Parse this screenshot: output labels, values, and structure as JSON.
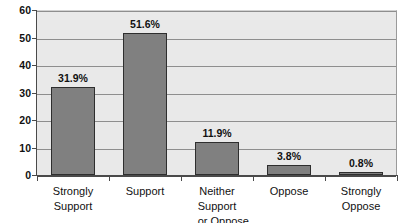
{
  "chart_data": {
    "type": "bar",
    "title": "",
    "subtitle": "",
    "xlabel": "",
    "ylabel": "",
    "ylim": [
      0,
      60
    ],
    "ytick_values": [
      0,
      10,
      20,
      30,
      40,
      50,
      60
    ],
    "ytick_labels": [
      "0",
      "10",
      "20",
      "30",
      "40",
      "50",
      "60"
    ],
    "grid": true,
    "legend": false,
    "legend_position": "none",
    "categories": [
      "Strongly Support",
      "Support",
      "Neither Support or Oppose",
      "Oppose",
      "Strongly Oppose"
    ],
    "category_label_lines": [
      [
        "Strongly",
        "Support"
      ],
      [
        "Support",
        ""
      ],
      [
        "Neither Support",
        "or Oppose"
      ],
      [
        "Oppose",
        ""
      ],
      [
        "Strongly",
        "Oppose"
      ]
    ],
    "values": [
      31.9,
      51.6,
      11.9,
      3.8,
      0.8
    ],
    "data_labels": [
      "31.9%",
      "51.6%",
      "11.9%",
      "3.8%",
      "0.8%"
    ],
    "bar_color": "#808080",
    "bar_border_color": "#2e2e2e",
    "plot_background": "#e9e9e9",
    "gridline_color": "#8e8e8e",
    "axis_color": "#4a4a4a",
    "text_color": "#111111"
  }
}
